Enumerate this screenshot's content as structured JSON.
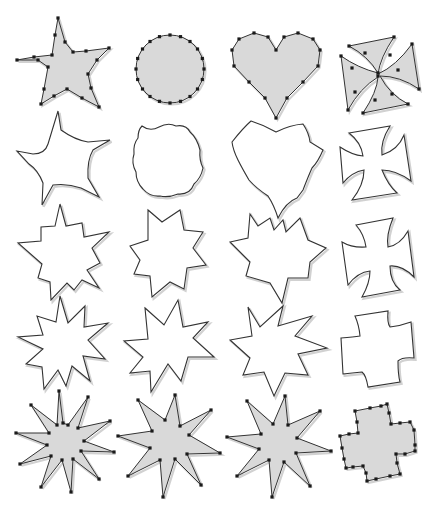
{
  "grid": {
    "rows": 5,
    "cols": 4
  },
  "colors": {
    "background": "#ffffff",
    "fill": "#d9d9d9",
    "stroke": "#333333",
    "vertex": "#1a1a1a",
    "shadow": "#bdbdbd"
  },
  "shapes": [
    {
      "id": "star-5-source",
      "row": 0,
      "col": 0,
      "style": "filled",
      "vertices": true,
      "points": [
        [
          58,
          18
        ],
        [
          65,
          42
        ],
        [
          73,
          52
        ],
        [
          86,
          51
        ],
        [
          109,
          48
        ],
        [
          97,
          60
        ],
        [
          88,
          74
        ],
        [
          91,
          88
        ],
        [
          99,
          107
        ],
        [
          82,
          98
        ],
        [
          67,
          89
        ],
        [
          54,
          96
        ],
        [
          41,
          104
        ],
        [
          44,
          89
        ],
        [
          48,
          67
        ],
        [
          38,
          60
        ],
        [
          17,
          60
        ],
        [
          34,
          57
        ],
        [
          52,
          55
        ],
        [
          55,
          35
        ]
      ]
    },
    {
      "id": "circle-source",
      "row": 0,
      "col": 1,
      "style": "filled",
      "vertices": true,
      "circle": {
        "cx": 170,
        "cy": 69,
        "r": 34,
        "n": 20
      }
    },
    {
      "id": "heart-source",
      "row": 0,
      "col": 2,
      "style": "filled",
      "vertices": true,
      "points": [
        [
          276,
          50
        ],
        [
          284,
          37
        ],
        [
          298,
          33
        ],
        [
          313,
          39
        ],
        [
          320,
          50
        ],
        [
          318,
          66
        ],
        [
          303,
          82
        ],
        [
          287,
          98
        ],
        [
          276,
          118
        ],
        [
          265,
          98
        ],
        [
          249,
          82
        ],
        [
          234,
          66
        ],
        [
          232,
          50
        ],
        [
          239,
          39
        ],
        [
          254,
          33
        ],
        [
          268,
          37
        ]
      ]
    },
    {
      "id": "cross-source",
      "row": 0,
      "col": 3,
      "style": "filled",
      "vertices": true,
      "path": "M349,46 L394,37 Q380,58 378,74 Q396,66 412,44 L419,89 Q400,76 380,76 Q390,95 408,104 L363,113 Q377,92 378,77 Q360,88 348,110 L341,56 Q358,68 378,73 Q368,56 349,46 Z",
      "points": [
        [
          349,
          46
        ],
        [
          394,
          37
        ],
        [
          412,
          44
        ],
        [
          419,
          89
        ],
        [
          408,
          104
        ],
        [
          363,
          113
        ],
        [
          348,
          110
        ],
        [
          341,
          56
        ],
        [
          378,
          73
        ],
        [
          378,
          76
        ],
        [
          365,
          53
        ],
        [
          390,
          55
        ],
        [
          398,
          70
        ],
        [
          392,
          94
        ],
        [
          375,
          100
        ],
        [
          355,
          92
        ],
        [
          352,
          68
        ]
      ]
    },
    {
      "id": "morph-1-star",
      "row": 1,
      "col": 0,
      "style": "outline",
      "path": "M58,111 L61,130 Q75,140 88,142 L110,140 L93,150 Q87,160 88,178 L99,197 L81,188 Q67,183 53,185 L42,205 L43,183 Q38,170 29,164 L17,151 L33,154 Q45,154 48,144 Z"
    },
    {
      "id": "morph-1-circle",
      "row": 1,
      "col": 1,
      "style": "outline",
      "path": "M142,126 Q150,132 159,127 Q168,122 176,126 Q186,124 190,132 Q197,138 200,150 Q199,160 203,168 Q201,178 194,184 Q190,195 178,194 Q168,198 160,196 Q150,197 143,189 Q136,182 136,172 Q131,163 134,154 Q133,144 138,138 Q138,130 142,126 Z"
    },
    {
      "id": "morph-1-heart",
      "row": 1,
      "col": 2,
      "style": "outline",
      "path": "M251,121 Q264,125 276,132 Q290,125 303,124 Q309,133 310,142 L323,150 Q318,162 312,168 Q308,177 303,190 L297,198 Q286,202 278,218 Q274,205 268,196 Q256,188 249,180 Q242,168 238,160 Q233,150 232,142 Q243,128 251,121 Z"
    },
    {
      "id": "morph-1-cross",
      "row": 1,
      "col": 3,
      "style": "outline",
      "path": "M349,133 L390,126 Q380,142 382,155 Q398,150 404,135 L411,181 Q396,170 382,170 Q388,185 397,193 L352,200 Q364,185 364,170 Q352,172 343,183 L340,147 Q352,155 363,156 Q361,142 349,133 Z"
    },
    {
      "id": "morph-2-star",
      "row": 2,
      "col": 0,
      "style": "outline",
      "path": "M60,204 L66,226 L82,223 L84,237 L109,232 L92,248 L100,263 L87,270 L99,288 L82,280 L74,290 L67,283 L51,300 L50,282 L38,278 L42,264 L18,243 L41,241 L41,227 L55,226 Z"
    },
    {
      "id": "morph-2-circle",
      "row": 2,
      "col": 1,
      "style": "outline",
      "path": "M148,210 L162,222 L180,210 L184,230 L203,232 L193,248 L206,265 L187,268 L184,289 L170,282 L152,297 L150,276 L134,274 L140,260 L130,246 L148,240 Z"
    },
    {
      "id": "morph-2-heart",
      "row": 2,
      "col": 2,
      "style": "outline",
      "path": "M250,214 L258,226 L270,218 L274,230 L283,220 L286,232 L300,218 L308,240 L326,248 L310,262 L308,278 L288,278 L282,303 L270,283 L246,276 L250,262 L230,242 L248,238 Z"
    },
    {
      "id": "morph-2-cross",
      "row": 2,
      "col": 3,
      "style": "outline",
      "path": "M356,225 L393,218 Q386,235 388,247 Q400,245 408,231 L414,277 Q402,265 390,266 Q390,282 400,290 L362,297 Q370,283 370,271 Q358,272 348,285 L342,242 Q352,248 366,247 Q364,234 356,225 Z"
    },
    {
      "id": "morph-3-star",
      "row": 3,
      "col": 0,
      "style": "outline",
      "path": "M60,296 L68,323 L85,306 L84,327 L108,323 L88,340 L105,359 L83,356 L90,381 L72,366 L66,386 L58,370 L44,389 L42,367 L26,364 L43,349 L18,337 L43,335 L37,316 L56,322 Z"
    },
    {
      "id": "morph-3-circle",
      "row": 3,
      "col": 1,
      "style": "outline",
      "path": "M145,308 L164,325 L178,300 L183,327 L208,322 L193,338 L214,357 L188,357 L181,381 L168,364 L151,392 L150,371 L130,373 L143,357 L124,341 L148,339 Z"
    },
    {
      "id": "morph-3-heart",
      "row": 3,
      "col": 2,
      "style": "outline",
      "path": "M248,307 L260,327 L283,306 L278,326 L312,316 L295,336 L327,348 L298,354 L308,375 L285,373 L274,396 L264,372 L243,375 L250,358 L230,340 L252,336 Z"
    },
    {
      "id": "morph-3-cross",
      "row": 3,
      "col": 3,
      "style": "outline",
      "path": "M355,316 L388,311 Q387,323 390,327 Q400,326 411,322 L414,358 Q402,357 398,361 Q398,375 400,382 L368,387 Q366,375 362,372 Q352,373 343,374 L341,338 Q354,337 360,336 Q359,325 355,316 Z"
    },
    {
      "id": "star-9-target",
      "row": 4,
      "col": 0,
      "style": "filled",
      "vertices": true,
      "points": [
        [
          59,
          391
        ],
        [
          63,
          423
        ],
        [
          68,
          425
        ],
        [
          88,
          397
        ],
        [
          78,
          428
        ],
        [
          110,
          421
        ],
        [
          84,
          441
        ],
        [
          114,
          452
        ],
        [
          81,
          451
        ],
        [
          99,
          479
        ],
        [
          73,
          459
        ],
        [
          71,
          492
        ],
        [
          62,
          460
        ],
        [
          41,
          487
        ],
        [
          51,
          456
        ],
        [
          20,
          464
        ],
        [
          47,
          445
        ],
        [
          16,
          433
        ],
        [
          49,
          433
        ],
        [
          31,
          405
        ],
        [
          57,
          425
        ]
      ]
    },
    {
      "id": "star-8-target-a",
      "row": 4,
      "col": 1,
      "style": "filled",
      "vertices": true,
      "points": [
        [
          175,
          395
        ],
        [
          180,
          426
        ],
        [
          211,
          410
        ],
        [
          189,
          435
        ],
        [
          220,
          453
        ],
        [
          187,
          454
        ],
        [
          201,
          485
        ],
        [
          175,
          459
        ],
        [
          163,
          497
        ],
        [
          160,
          460
        ],
        [
          128,
          476
        ],
        [
          150,
          448
        ],
        [
          118,
          436
        ],
        [
          152,
          431
        ],
        [
          138,
          400
        ],
        [
          165,
          420
        ]
      ]
    },
    {
      "id": "star-8-target-b",
      "row": 4,
      "col": 2,
      "style": "filled",
      "vertices": true,
      "points": [
        [
          285,
          396
        ],
        [
          288,
          425
        ],
        [
          320,
          411
        ],
        [
          297,
          438
        ],
        [
          331,
          451
        ],
        [
          296,
          453
        ],
        [
          310,
          486
        ],
        [
          284,
          462
        ],
        [
          272,
          497
        ],
        [
          269,
          460
        ],
        [
          237,
          476
        ],
        [
          259,
          449
        ],
        [
          227,
          437
        ],
        [
          261,
          434
        ],
        [
          247,
          401
        ],
        [
          273,
          424
        ]
      ]
    },
    {
      "id": "cross-target",
      "row": 4,
      "col": 3,
      "style": "filled",
      "vertices": true,
      "points": [
        [
          355,
          411
        ],
        [
          370,
          408
        ],
        [
          381,
          406
        ],
        [
          387,
          404
        ],
        [
          389,
          413
        ],
        [
          391,
          424
        ],
        [
          400,
          423
        ],
        [
          410,
          422
        ],
        [
          414,
          430
        ],
        [
          415,
          445
        ],
        [
          415,
          451
        ],
        [
          405,
          454
        ],
        [
          396,
          454
        ],
        [
          397,
          463
        ],
        [
          400,
          474
        ],
        [
          390,
          476
        ],
        [
          376,
          479
        ],
        [
          367,
          481
        ],
        [
          366,
          473
        ],
        [
          363,
          466
        ],
        [
          353,
          467
        ],
        [
          346,
          468
        ],
        [
          344,
          459
        ],
        [
          342,
          448
        ],
        [
          340,
          436
        ],
        [
          349,
          434
        ],
        [
          358,
          433
        ],
        [
          357,
          422
        ]
      ]
    }
  ]
}
